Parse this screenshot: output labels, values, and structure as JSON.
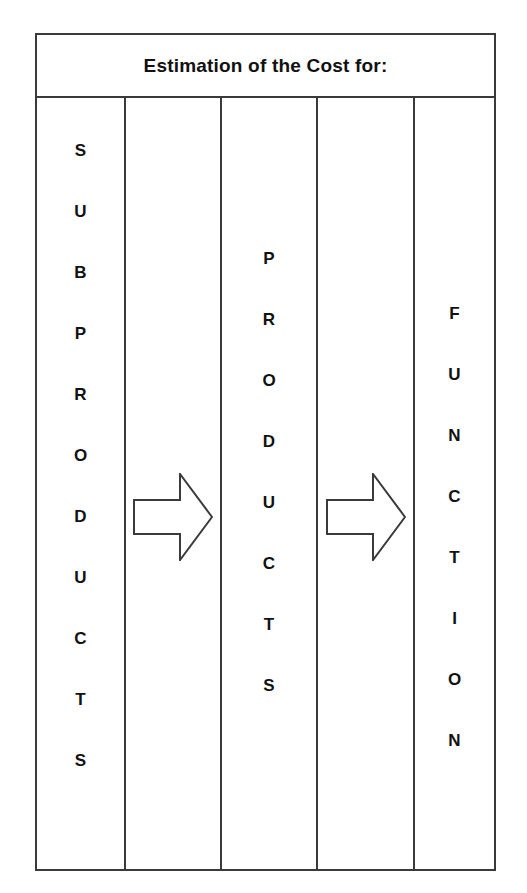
{
  "diagram": {
    "header": {
      "title": "Estimation of the Cost for:"
    },
    "columns": [
      {
        "name": "subproducts",
        "kind": "vertical-text",
        "text": "SUBPRODUCTS",
        "letters": [
          "S",
          "U",
          "B",
          "P",
          "R",
          "O",
          "D",
          "U",
          "C",
          "T",
          "S"
        ]
      },
      {
        "name": "arrow-1",
        "kind": "arrow",
        "icon": "arrow-right-icon",
        "direction": "right"
      },
      {
        "name": "products",
        "kind": "vertical-text",
        "text": "PRODUCTS",
        "letters": [
          "P",
          "R",
          "O",
          "D",
          "U",
          "C",
          "T",
          "S"
        ]
      },
      {
        "name": "arrow-2",
        "kind": "arrow",
        "icon": "arrow-right-icon",
        "direction": "right"
      },
      {
        "name": "function",
        "kind": "vertical-text",
        "text": "FUNCTION",
        "letters": [
          "F",
          "U",
          "N",
          "C",
          "T",
          "I",
          "O",
          "N"
        ]
      }
    ],
    "colors": {
      "border": "#3a3a3a",
      "text": "#111111",
      "background": "#ffffff",
      "arrow_stroke": "#3a3a3a"
    }
  }
}
